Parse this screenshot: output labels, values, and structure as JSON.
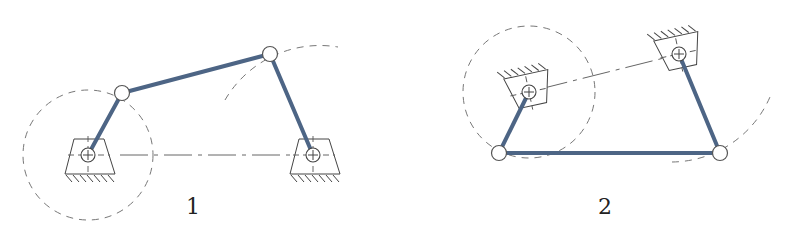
{
  "colors": {
    "link": "#4d6585",
    "guide": "#777777",
    "outline": "#444444",
    "background": "#ffffff"
  },
  "diagrams": [
    {
      "label": "1",
      "description": "four-bar linkage with supports below",
      "ground_pivots": [
        [
          88,
          155
        ],
        [
          313,
          155
        ]
      ],
      "moving_joints": [
        [
          122,
          93
        ],
        [
          270,
          54
        ]
      ]
    },
    {
      "label": "2",
      "description": "four-bar linkage with inverted supports above",
      "ground_pivots": [
        [
          529,
          92
        ],
        [
          679,
          54
        ]
      ],
      "moving_joints": [
        [
          499,
          153
        ],
        [
          720,
          153
        ]
      ]
    }
  ]
}
